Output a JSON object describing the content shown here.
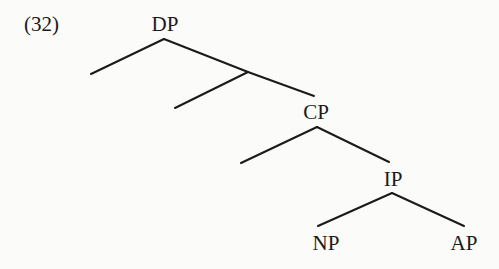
{
  "example": {
    "number": "(32)"
  },
  "tree": {
    "nodes": {
      "dp": {
        "label": "DP",
        "x": 165,
        "y": 24
      },
      "cp": {
        "label": "CP",
        "x": 316,
        "y": 112
      },
      "ip": {
        "label": "IP",
        "x": 393,
        "y": 179
      },
      "np": {
        "label": "NP",
        "x": 326,
        "y": 243
      },
      "ap": {
        "label": "AP",
        "x": 464,
        "y": 243
      }
    },
    "edges": [
      {
        "from": "DP",
        "to": "empty-left-1",
        "x1": 164,
        "y1": 39,
        "x2": 91,
        "y2": 74
      },
      {
        "from": "DP",
        "to": "intermediate",
        "x1": 164,
        "y1": 39,
        "x2": 248,
        "y2": 72
      },
      {
        "from": "intermediate",
        "to": "empty-left-2",
        "x1": 248,
        "y1": 72,
        "x2": 175,
        "y2": 108
      },
      {
        "from": "intermediate",
        "to": "CP",
        "x1": 248,
        "y1": 72,
        "x2": 314,
        "y2": 96
      },
      {
        "from": "CP",
        "to": "empty-left-3",
        "x1": 317,
        "y1": 127,
        "x2": 241,
        "y2": 163
      },
      {
        "from": "CP",
        "to": "IP",
        "x1": 317,
        "y1": 127,
        "x2": 389,
        "y2": 162
      },
      {
        "from": "IP",
        "to": "NP",
        "x1": 392,
        "y1": 193,
        "x2": 318,
        "y2": 226
      },
      {
        "from": "IP",
        "to": "AP",
        "x1": 392,
        "y1": 193,
        "x2": 464,
        "y2": 226
      }
    ],
    "line_color": "#1a1a1a"
  }
}
